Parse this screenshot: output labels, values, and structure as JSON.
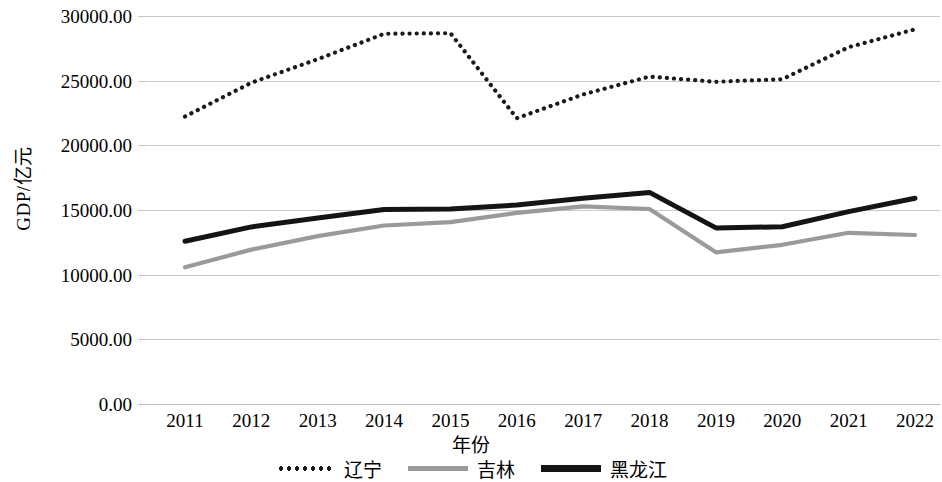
{
  "chart_data": {
    "type": "line",
    "title": "",
    "xlabel": "年份",
    "ylabel": "GDP/亿元",
    "categories": [
      "2011",
      "2012",
      "2013",
      "2014",
      "2015",
      "2016",
      "2017",
      "2018",
      "2019",
      "2020",
      "2021",
      "2022"
    ],
    "ylim": [
      0,
      30000
    ],
    "ytick_labels": [
      "0.00",
      "5000.00",
      "10000.00",
      "15000.00",
      "20000.00",
      "25000.00",
      "30000.00"
    ],
    "ytick_values": [
      0,
      5000,
      10000,
      15000,
      20000,
      25000,
      30000
    ],
    "grid": "horizontal",
    "legend_position": "bottom",
    "series": [
      {
        "name": "辽宁",
        "style": "dotted",
        "color": "#1a1a1a",
        "values": [
          22226,
          24846,
          26656,
          28627,
          28669,
          22100,
          23942,
          25315,
          24910,
          25115,
          27584,
          28975
        ]
      },
      {
        "name": "吉林",
        "style": "solid",
        "color": "#9a9a9a",
        "values": [
          10569,
          11938,
          12981,
          13803,
          14063,
          14776,
          15288,
          15074,
          11727,
          12311,
          13236,
          13070
        ]
      },
      {
        "name": "黑龙江",
        "style": "solid",
        "color": "#141414",
        "values": [
          12582,
          13692,
          14382,
          15039,
          15083,
          15386,
          15903,
          16362,
          13613,
          13699,
          14879,
          15901
        ]
      }
    ]
  },
  "legend": {
    "items": [
      {
        "label": "辽宁",
        "style": "dotted"
      },
      {
        "label": "吉林",
        "style": "solid-gray"
      },
      {
        "label": "黑龙江",
        "style": "solid-black"
      }
    ]
  }
}
